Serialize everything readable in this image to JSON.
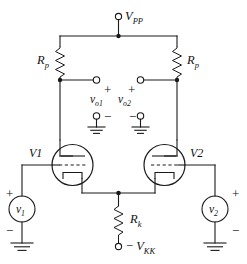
{
  "figure": {
    "type": "schematic",
    "supply": {
      "top_terminal_label": "V",
      "top_terminal_sub": "PP",
      "bottom_terminal_sign": "−",
      "bottom_terminal_label": "V",
      "bottom_terminal_sub": "KK"
    },
    "resistors": [
      {
        "name": "plate-resistor-left",
        "label": "R",
        "sub": "p"
      },
      {
        "name": "plate-resistor-right",
        "label": "R",
        "sub": "p"
      },
      {
        "name": "cathode-resistor",
        "label": "R",
        "sub": "k"
      }
    ],
    "tubes": [
      {
        "name": "tube-left",
        "label": "V1"
      },
      {
        "name": "tube-right",
        "label": "V2"
      }
    ],
    "outputs": [
      {
        "name": "output-left",
        "label": "v",
        "sub": "o1",
        "plus": "+",
        "minus": "−"
      },
      {
        "name": "output-right",
        "label": "v",
        "sub": "o2",
        "plus": "+",
        "minus": "−"
      }
    ],
    "sources": [
      {
        "name": "input-source-left",
        "label": "v",
        "sub": "1",
        "plus": "+",
        "minus": "−"
      },
      {
        "name": "input-source-right",
        "label": "v",
        "sub": "2",
        "plus": "+",
        "minus": "−"
      }
    ],
    "grounds": [
      "ground-output-left",
      "ground-output-right",
      "ground-source-left",
      "ground-source-right"
    ],
    "colors": {
      "ink": "#1a1a1a",
      "background": "#ffffff"
    }
  }
}
